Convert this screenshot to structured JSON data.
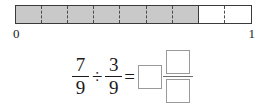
{
  "figure": {
    "name": "fraction-bar-number-line",
    "total_parts": 9,
    "shaded_parts": 7,
    "unshaded_parts": 2,
    "shaded_color": "#c9c9c9",
    "unshaded_color": "#ffffff",
    "border_color": "#3a3a3a",
    "axis": {
      "start_label": "0",
      "end_label": "1"
    }
  },
  "equation": {
    "dividend": {
      "numerator": "7",
      "denominator": "9"
    },
    "divide_symbol": "÷",
    "divisor": {
      "numerator": "3",
      "denominator": "9"
    },
    "equals_symbol": "=",
    "answer": {
      "whole": "",
      "numerator": "",
      "denominator": ""
    }
  }
}
